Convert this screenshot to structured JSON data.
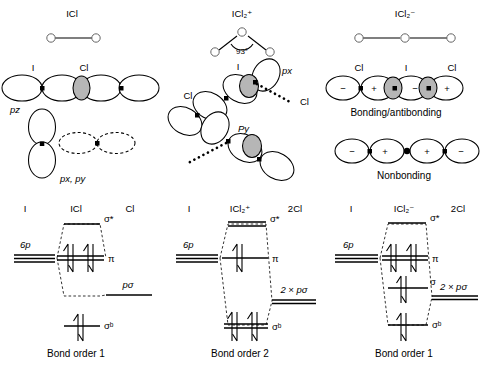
{
  "figure": {
    "columns": [
      {
        "id": "icl",
        "species_label": "ICl",
        "geometry": "linear",
        "atoms": [
          "I",
          "Cl"
        ],
        "orbital_rows": [
          {
            "name": "pz-sigma-overlap",
            "atom_labels": [
              "I",
              "Cl"
            ],
            "orbital_label": "pz",
            "style": "solid-with-shaded-overlap"
          },
          {
            "name": "px-py-pi-overlap",
            "atom_labels": [],
            "orbital_label": "px, py",
            "style": "solid-and-dashed"
          }
        ],
        "mo": {
          "left_atom": "I",
          "center": "ICl",
          "right_atom": "Cl",
          "left_level_label": "6p",
          "right_level_label": "pσ",
          "levels": [
            {
              "label": "σ*",
              "electrons": 0
            },
            {
              "label": "π",
              "electrons": 4
            },
            {
              "label": "σᵇ",
              "electrons": 2
            }
          ],
          "caption": "Bond order 1"
        }
      },
      {
        "id": "icl2plus",
        "species_label": "ICl₂⁺",
        "geometry": "bent",
        "bond_angle": "93°",
        "atoms": [
          "I",
          "Cl",
          "Cl"
        ],
        "orbital_rows": [
          {
            "name": "px-overlap",
            "atom_labels": [
              "I",
              "Cl",
              "Cl"
            ],
            "orbital_label": "px",
            "style": "solid-with-shaded-overlap"
          },
          {
            "name": "py-overlap",
            "atom_labels": [],
            "orbital_label": "Py",
            "style": "solid-with-shaded-overlap"
          }
        ],
        "mo": {
          "left_atom": "I",
          "center": "ICl₂⁺",
          "right_atom": "2Cl",
          "left_level_label": "6p",
          "right_level_label": "2 × pσ",
          "levels": [
            {
              "label": "σ*",
              "electrons": 0
            },
            {
              "label": "π",
              "electrons": 2
            },
            {
              "label": "σᵇ",
              "electrons": 4
            }
          ],
          "caption": "Bond order 2"
        }
      },
      {
        "id": "icl2minus",
        "species_label": "ICl₂⁻",
        "geometry": "linear",
        "atoms": [
          "Cl",
          "I",
          "Cl"
        ],
        "orbital_rows": [
          {
            "name": "bonding-antibonding",
            "atom_labels": [
              "Cl",
              "I",
              "Cl"
            ],
            "signs": [
              "−",
              "+",
              "−",
              "+"
            ],
            "orbital_label": "Bonding/antibonding",
            "style": "solid-with-shaded-overlap"
          },
          {
            "name": "nonbonding",
            "atom_labels": [],
            "signs": [
              "−",
              "+",
              "+",
              "−"
            ],
            "orbital_label": "Nonbonding",
            "style": "solid-with-node-dot"
          }
        ],
        "mo": {
          "left_atom": "I",
          "center": "ICl₂⁻",
          "right_atom": "2Cl",
          "left_level_label": "6p",
          "right_level_label": "2 × pσ",
          "levels": [
            {
              "label": "σ*",
              "electrons": 0
            },
            {
              "label": "π",
              "electrons": 4
            },
            {
              "label": "σ",
              "electrons": 2
            },
            {
              "label": "σᵇ",
              "electrons": 2
            }
          ],
          "caption": "Bond order 1"
        }
      }
    ],
    "colors": {
      "stroke": "#000000",
      "overlap_shade": "#b6b6b6",
      "background": "#ffffff",
      "atom_circle_stroke": "#666666"
    }
  }
}
